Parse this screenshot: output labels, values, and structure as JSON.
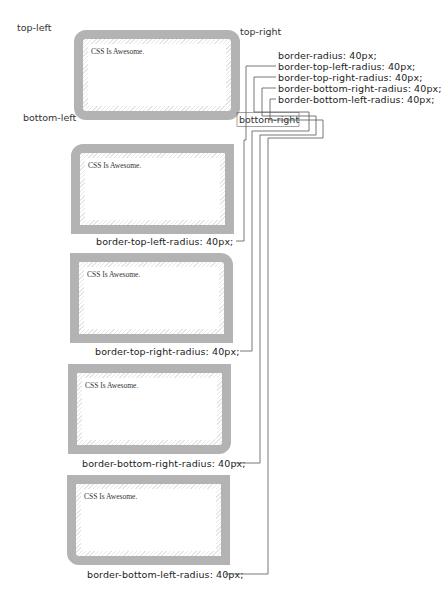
{
  "diagram": {
    "corner_labels": {
      "top_left": "top-left",
      "top_right": "top-right",
      "bottom_left": "bottom-left",
      "bottom_right": "bottom-right"
    },
    "sample_text": "CSS Is Awesome.",
    "code_list": [
      "border-radius: 40px;",
      "border-top-left-radius: 40px;",
      "border-top-right-radius: 40px;",
      "border-bottom-right-radius: 40px;",
      "border-bottom-left-radius: 40px;"
    ],
    "examples": [
      {
        "caption": "border-top-left-radius: 40px;"
      },
      {
        "caption": "border-top-right-radius: 40px;"
      },
      {
        "caption": "border-bottom-right-radius: 40px;"
      },
      {
        "caption": "border-bottom-left-radius: 40px;"
      }
    ],
    "colors": {
      "border": "#b3b3b3",
      "lines": "#555555",
      "text": "#333333"
    }
  }
}
